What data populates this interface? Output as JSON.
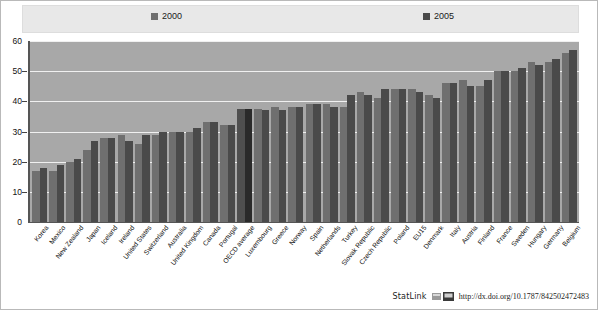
{
  "legend": {
    "series": [
      {
        "label": "2000",
        "color": "#6f6f6f"
      },
      {
        "label": "2005",
        "color": "#4a4a4a"
      }
    ]
  },
  "footer": {
    "statlink_label": "StatLink",
    "url": "http://dx.doi.org/10.1787/842502472483",
    "icon": "statlink-icon"
  },
  "chart_data": {
    "type": "bar",
    "title": "",
    "subtitle": "",
    "xlabel": "",
    "ylabel": "",
    "ylim": [
      0,
      60
    ],
    "yticks": [
      0,
      10,
      20,
      30,
      40,
      50,
      60
    ],
    "grid": true,
    "legend_position": "top",
    "highlight_category": "OECD average",
    "categories": [
      "Korea",
      "Mexico",
      "New Zealand",
      "Japan",
      "Iceland",
      "Ireland",
      "United States",
      "Switzerland",
      "Australia",
      "United Kingdom",
      "Canada",
      "Portugal",
      "OECD average",
      "Luxembourg",
      "Greece",
      "Norway",
      "Spain",
      "Netherlands",
      "Turkey",
      "Slovak Republic",
      "Czech Republic",
      "Poland",
      "EU15",
      "Denmark",
      "Italy",
      "Austria",
      "Finland",
      "France",
      "Sweden",
      "Hungary",
      "Germany",
      "Belgium"
    ],
    "series": [
      {
        "name": "2000",
        "color": "#6f6f6f",
        "values": [
          17,
          17,
          20,
          24,
          28,
          29,
          26,
          29,
          30,
          30,
          33,
          32,
          37.5,
          37.5,
          38,
          38,
          39,
          39,
          38,
          43,
          41,
          44,
          44,
          42,
          46,
          47,
          45,
          50,
          50,
          53,
          53,
          56
        ]
      },
      {
        "name": "2005",
        "color": "#4a4a4a",
        "values": [
          18,
          19,
          21,
          27,
          28,
          27,
          29,
          30,
          30,
          31,
          33,
          32,
          37.5,
          37,
          37,
          38,
          39,
          38,
          42,
          42,
          44,
          44,
          43,
          41,
          46,
          45,
          47,
          50,
          51,
          52,
          54,
          57
        ]
      }
    ]
  }
}
